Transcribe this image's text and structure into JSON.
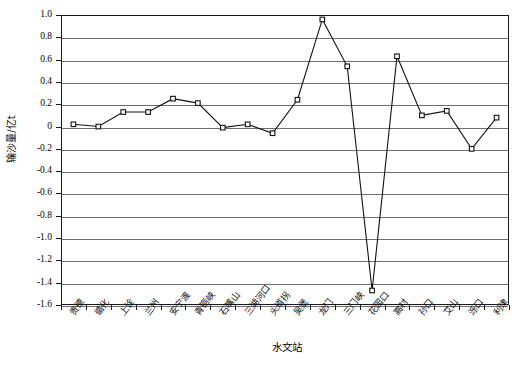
{
  "chart_data": {
    "type": "line",
    "title": "",
    "xlabel": "水文站",
    "ylabel": "输沙量/亿t",
    "ylim": [
      -1.6,
      1.0
    ],
    "ytick_step": 0.2,
    "grid": true,
    "legend": "none",
    "marker": "open-square",
    "line_color": "#111111",
    "grid_color": "#6e6e6e",
    "categories": [
      "贵德",
      "循化",
      "上诠",
      "兰州",
      "安宁渡",
      "青铜峡",
      "石嘴山",
      "三湖河口",
      "头道拐",
      "吴堡",
      "龙门",
      "三门峡",
      "花园口",
      "高村",
      "孙口",
      "艾山",
      "泺口",
      "利津"
    ],
    "values": [
      0.02,
      0.0,
      0.13,
      0.13,
      0.25,
      0.21,
      -0.01,
      0.02,
      -0.06,
      0.24,
      0.96,
      0.54,
      -1.47,
      0.63,
      0.1,
      0.14,
      -0.2,
      0.08
    ],
    "ytick_labels": [
      "1.0",
      "0.8",
      "0.6",
      "0.4",
      "0.2",
      "0",
      "-0.2",
      "-0.4",
      "-0.6",
      "-0.8",
      "-1.0",
      "-1.2",
      "-1.4",
      "-1.6"
    ],
    "ytick_values": [
      1.0,
      0.8,
      0.6,
      0.4,
      0.2,
      0,
      -0.2,
      -0.4,
      -0.6,
      -0.8,
      -1.0,
      -1.2,
      -1.4,
      -1.6
    ]
  }
}
